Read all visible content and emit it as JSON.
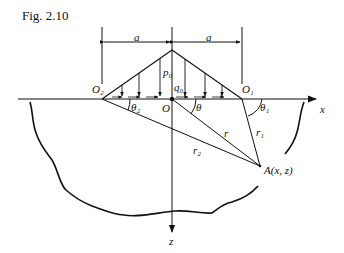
{
  "figure": {
    "title": "Fig. 2.10",
    "labels": {
      "dim_left": "a",
      "dim_right": "a",
      "p0": "p₀",
      "q0": "q₀",
      "O": "O",
      "O1": "O₁",
      "O2": "O₂",
      "theta": "θ",
      "theta1": "θ₁",
      "theta2": "θ₂",
      "r": "r",
      "r1": "r₁",
      "r2": "r₂",
      "A": "A(x, z)",
      "x_axis": "x",
      "z_axis": "z"
    }
  }
}
